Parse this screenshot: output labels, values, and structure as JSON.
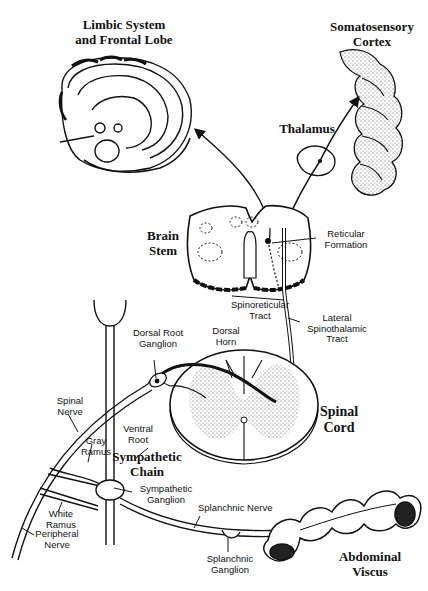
{
  "diagram": {
    "title_regions": {
      "limbic": "Limbic System and Frontal Lobe",
      "somatosensory": "Somatosensory Cortex"
    },
    "labels": {
      "limbic_line1": "Limbic System",
      "limbic_line2": "and Frontal Lobe",
      "soma_line1": "Somatosensory",
      "soma_line2": "Cortex",
      "thalamus": "Thalamus",
      "brain_stem_line1": "Brain",
      "brain_stem_line2": "Stem",
      "reticular_line1": "Reticular",
      "reticular_line2": "Formation",
      "spinoreticular_line1": "Spinoreticular",
      "spinoreticular_line2": "Tract",
      "lateral_line1": "Lateral",
      "lateral_line2": "Spinothalamic",
      "lateral_line3": "Tract",
      "drg_line1": "Dorsal Root",
      "drg_line2": "Ganglion",
      "dorsal_horn_line1": "Dorsal",
      "dorsal_horn_line2": "Horn",
      "spinal_cord_line1": "Spinal",
      "spinal_cord_line2": "Cord",
      "spinal_nerve_line1": "Spinal",
      "spinal_nerve_line2": "Nerve",
      "gray_ramus_line1": "Gray",
      "gray_ramus_line2": "Ramus",
      "ventral_root_line1": "Ventral",
      "ventral_root_line2": "Root",
      "sympathetic_chain_line1": "Sympathetic",
      "sympathetic_chain_line2": "Chain",
      "sympathetic_ganglion_line1": "Sympathetic",
      "sympathetic_ganglion_line2": "Ganglion",
      "white_ramus_line1": "White",
      "white_ramus_line2": "Ramus",
      "peripheral_nerve_line1": "Peripheral",
      "peripheral_nerve_line2": "Nerve",
      "splanchnic_nerve": "Splanchnic Nerve",
      "splanchnic_ganglion_line1": "Splanchnic",
      "splanchnic_ganglion_line2": "Ganglion",
      "abdominal_line1": "Abdominal",
      "abdominal_line2": "Viscus"
    },
    "colors": {
      "ink": "#111111",
      "paper": "#ffffff",
      "stipple": "#555555"
    }
  }
}
